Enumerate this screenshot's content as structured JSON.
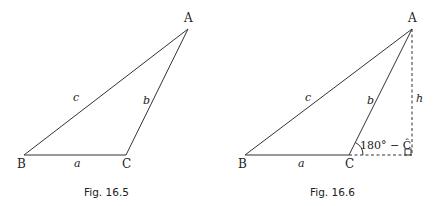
{
  "figures": [
    {
      "caption": "Fig. 16.5",
      "vertices": {
        "A": "A",
        "B": "B",
        "C": "C"
      },
      "sides": {
        "a": "a",
        "b": "b",
        "c": "c"
      }
    },
    {
      "caption": "Fig. 16.6",
      "vertices": {
        "A": "A",
        "B": "B",
        "C": "C"
      },
      "sides": {
        "a": "a",
        "b": "b",
        "c": "c",
        "h": "h"
      },
      "angle_label": "180° − Ĉ"
    }
  ]
}
